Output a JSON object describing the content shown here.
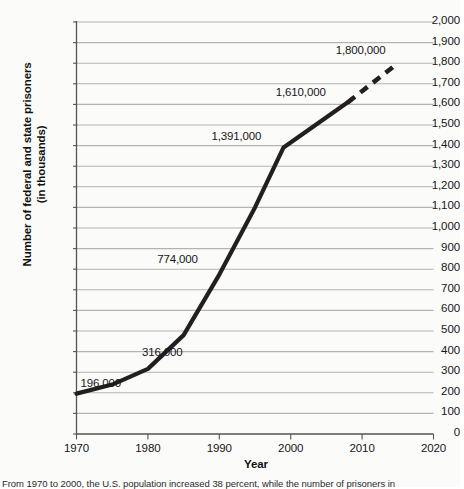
{
  "chart_data": {
    "type": "line",
    "title": "",
    "xlabel": "Year",
    "ylabel": "Number of federal and state prisoners\n(in thousands)",
    "ylabel_line1": "Number of federal and state prisoners",
    "ylabel_line2": "(in thousands)",
    "xlim": [
      1970,
      2020
    ],
    "ylim": [
      0,
      2000
    ],
    "grid": true,
    "legend": "none",
    "x_ticks": [
      1970,
      1980,
      1990,
      2000,
      2010,
      2020
    ],
    "x_tick_labels": [
      "1970",
      "1980",
      "1990",
      "2000",
      "2010",
      "2020"
    ],
    "y_ticks": [
      0,
      100,
      200,
      300,
      400,
      500,
      600,
      700,
      800,
      900,
      1000,
      1100,
      1200,
      1300,
      1400,
      1500,
      1600,
      1700,
      1800,
      1900,
      2000
    ],
    "y_tick_labels": [
      "0",
      "100",
      "200",
      "300",
      "400",
      "500",
      "600",
      "700",
      "800",
      "900",
      "1,000",
      "1,100",
      "1,200",
      "1,300",
      "1,400",
      "1,500",
      "1,600",
      "1,700",
      "1,800",
      "1,900",
      "2,000"
    ],
    "series": [
      {
        "name": "Actual prisoners (solid)",
        "style": "solid",
        "color": "#231f20",
        "x": [
          1970,
          1975,
          1980,
          1985,
          1990,
          1995,
          1999,
          2008
        ],
        "y": [
          196,
          240,
          316,
          480,
          774,
          1100,
          1391,
          1610
        ]
      },
      {
        "name": "Projected prisoners (dashed)",
        "style": "dashed",
        "color": "#231f20",
        "x": [
          2008,
          2015
        ],
        "y": [
          1610,
          1800
        ]
      }
    ],
    "annotations": [
      {
        "text": "196,000",
        "x": 1970,
        "y": 196
      },
      {
        "text": "316,000",
        "x": 1980,
        "y": 316
      },
      {
        "text": "774,000",
        "x": 1990,
        "y": 774
      },
      {
        "text": "1,391,000",
        "x": 1999,
        "y": 1391
      },
      {
        "text": "1,610,000",
        "x": 2008,
        "y": 1610
      },
      {
        "text": "1,800,000",
        "x": 2015,
        "y": 1800
      }
    ],
    "colors": {
      "line": "#231f20",
      "grid": "#b3b3b3",
      "axis": "#555555",
      "background": "#fbfbfa",
      "text": "#161616"
    }
  },
  "caption": {
    "text": "From 1970 to 2000, the U.S. population increased 38 percent, while the number of prisoners in"
  }
}
